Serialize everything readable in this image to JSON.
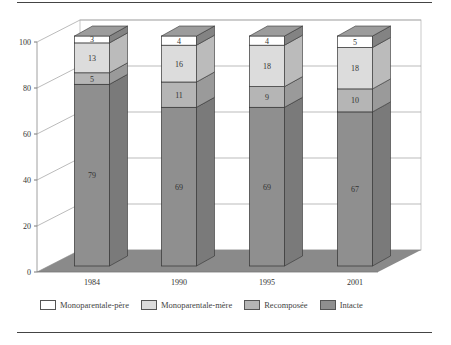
{
  "chart_data": {
    "type": "bar",
    "stacked": true,
    "three_d": true,
    "title": "",
    "xlabel": "",
    "ylabel": "",
    "categories": [
      "1984",
      "1990",
      "1995",
      "2001"
    ],
    "series": [
      {
        "name": "Intacte",
        "color": "#8f8f8f",
        "values": [
          79,
          69,
          69,
          67
        ]
      },
      {
        "name": "Recomposée",
        "color": "#b5b5b5",
        "values": [
          5,
          11,
          9,
          10
        ]
      },
      {
        "name": "Monoparentale-mère",
        "color": "#dcdcdc",
        "values": [
          13,
          16,
          18,
          18
        ]
      },
      {
        "name": "Monoparentale-père",
        "color": "#ffffff",
        "values": [
          3,
          4,
          4,
          5
        ]
      }
    ],
    "yticks": [
      0,
      20,
      40,
      60,
      80,
      100
    ],
    "ylim": [
      0,
      100
    ],
    "grid": true,
    "legend_position": "bottom",
    "data_labels": true
  },
  "legend": {
    "items": [
      {
        "label": "Monoparentale-père",
        "color": "#ffffff"
      },
      {
        "label": "Monoparentale-mère",
        "color": "#dcdcdc"
      },
      {
        "label": "Recomposée",
        "color": "#b5b5b5"
      },
      {
        "label": "Intacte",
        "color": "#8f8f8f"
      }
    ]
  }
}
